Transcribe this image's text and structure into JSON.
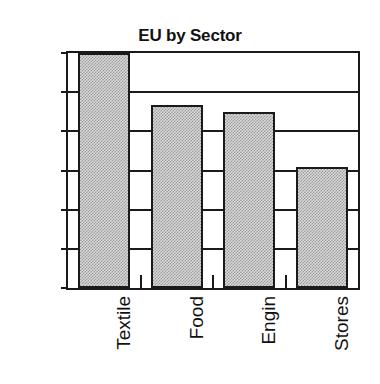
{
  "chart_data": {
    "type": "bar",
    "title": "EU by Sector",
    "xlabel": "",
    "ylabel": "",
    "categories": [
      "Textile",
      "Food",
      "Engin",
      "Stores"
    ],
    "values": [
      1.5,
      1.2,
      1.15,
      0.82
    ],
    "series": [
      {
        "name": "EU by Sector",
        "values": [
          1.5,
          1.2,
          1.15,
          0.82
        ]
      }
    ],
    "ytick_labels": [
      "1.5",
      "1.3",
      "1.0",
      "0.8",
      "0.5",
      "0.3",
      "0.0"
    ],
    "ytick_values": [
      1.5,
      1.3,
      1.0,
      0.8,
      0.5,
      0.3,
      0.0
    ],
    "ylim": [
      0.0,
      1.5
    ],
    "grid": "horizontal",
    "legend": "none",
    "bar_fill_color": "#d9d9d9",
    "bar_edge_color": "#1a1a1a",
    "background_color": "#ffffff",
    "xlabel_rotation": "90",
    "annotations": []
  },
  "figure": {
    "title_text": "EU by Sector"
  }
}
